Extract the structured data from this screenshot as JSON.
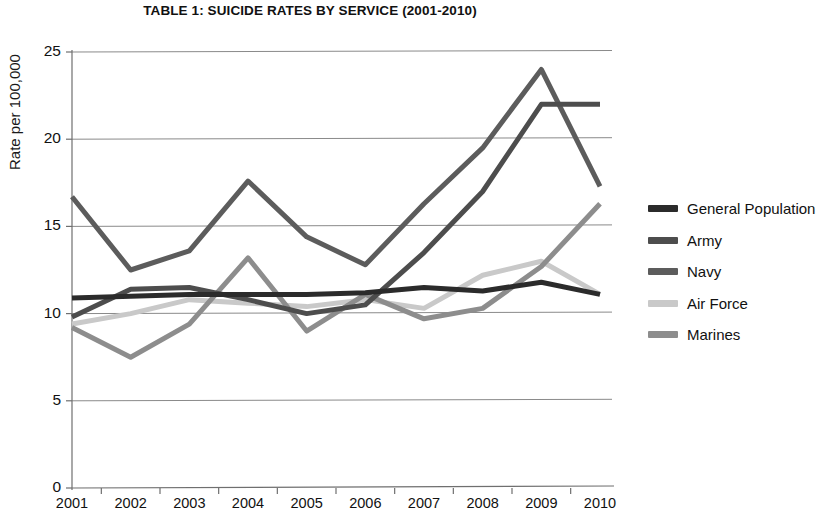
{
  "chart_data": {
    "type": "line",
    "title": "TABLE 1: SUICIDE RATES BY SERVICE (2001-2010)",
    "xlabel": "",
    "ylabel": "Rate per 100,000",
    "categories": [
      "2001",
      "2002",
      "2003",
      "2004",
      "2005",
      "2006",
      "2007",
      "2008",
      "2009",
      "2010"
    ],
    "x_tick_labels": [
      "2001",
      "2002",
      "2003",
      "2004",
      "2005",
      "2006",
      "2007",
      "2008",
      "2009",
      "2010"
    ],
    "y_tick_labels": [
      "0",
      "5",
      "10",
      "15",
      "20",
      "25"
    ],
    "y_ticks": [
      0,
      5,
      10,
      15,
      20,
      25
    ],
    "ylim": [
      0,
      25
    ],
    "grid": "horizontal",
    "legend_position": "right",
    "series": [
      {
        "name": "General Population",
        "color": "#2b2b2b",
        "values": [
          10.9,
          11.0,
          11.1,
          11.1,
          11.1,
          11.2,
          11.5,
          11.3,
          11.8,
          11.1
        ]
      },
      {
        "name": "Army",
        "color": "#4d4d4d",
        "values": [
          9.8,
          11.4,
          11.5,
          10.8,
          10.0,
          10.5,
          13.5,
          17.0,
          22.0,
          22.0
        ]
      },
      {
        "name": "Navy",
        "color": "#5c5c5c",
        "values": [
          16.7,
          12.5,
          13.6,
          17.6,
          14.4,
          12.8,
          16.3,
          19.5,
          24.0,
          17.3
        ]
      },
      {
        "name": "Air Force",
        "color": "#c9c9c9",
        "values": [
          9.4,
          10.0,
          10.8,
          10.6,
          10.4,
          10.8,
          10.3,
          12.2,
          13.0,
          11.1
        ]
      },
      {
        "name": "Marines",
        "color": "#8d8d8d",
        "values": [
          9.2,
          7.5,
          9.4,
          13.2,
          9.0,
          11.1,
          9.7,
          10.3,
          12.7,
          16.3
        ]
      }
    ]
  },
  "legend": {
    "items": [
      {
        "label": "General Population",
        "color": "#2b2b2b"
      },
      {
        "label": "Army",
        "color": "#4d4d4d"
      },
      {
        "label": "Navy",
        "color": "#5c5c5c"
      },
      {
        "label": "Air Force",
        "color": "#c9c9c9"
      },
      {
        "label": "Marines",
        "color": "#8d8d8d"
      }
    ]
  }
}
